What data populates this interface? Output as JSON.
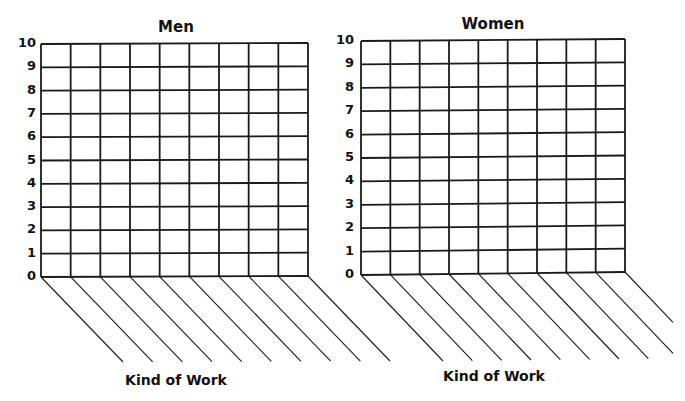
{
  "chart_data": [
    {
      "type": "bar",
      "title": "Men",
      "xlabel": "Kind of Work",
      "ylabel": "",
      "ylim": [
        0,
        10
      ],
      "yticks": [
        0,
        1,
        2,
        3,
        4,
        5,
        6,
        7,
        8,
        9,
        10
      ],
      "categories": [
        "",
        "",
        "",
        "",
        "",
        "",
        "",
        "",
        "",
        ""
      ],
      "values": [],
      "grid": true,
      "note": "blank bar graph template with 9 grid columns and 10 slanted category label lines",
      "layout": {
        "x0": 41,
        "x1": 308,
        "yTop0": 44,
        "yTop1": 43,
        "yBot0": 277,
        "yBot1": 276,
        "cols": 9,
        "rows": 10,
        "diagDx": 82,
        "diagDy": 85,
        "titleX": 176,
        "titleY": 18,
        "xlabelX": 176,
        "xlabelY": 372,
        "tickX": 12
      }
    },
    {
      "type": "bar",
      "title": "Women",
      "xlabel": "Kind of Work",
      "ylabel": "",
      "ylim": [
        0,
        10
      ],
      "yticks": [
        0,
        1,
        2,
        3,
        4,
        5,
        6,
        7,
        8,
        9,
        10
      ],
      "categories": [
        "",
        "",
        "",
        "",
        "",
        "",
        "",
        "",
        "",
        ""
      ],
      "values": [],
      "grid": true,
      "note": "blank bar graph template with 9 grid columns and 10 slanted category label lines",
      "layout": {
        "x0": 361,
        "x1": 625,
        "yTop0": 41,
        "yTop1": 39,
        "yBot0": 275,
        "yBot1": 272,
        "cols": 9,
        "rows": 10,
        "diagDx": 82,
        "diagDy": 86,
        "titleX": 493,
        "titleY": 15,
        "xlabelX": 494,
        "xlabelY": 368,
        "tickX": 330
      }
    }
  ],
  "charts": {
    "men": {
      "title": "Men",
      "xlabel": "Kind of Work"
    },
    "women": {
      "title": "Women",
      "xlabel": "Kind of Work"
    }
  }
}
